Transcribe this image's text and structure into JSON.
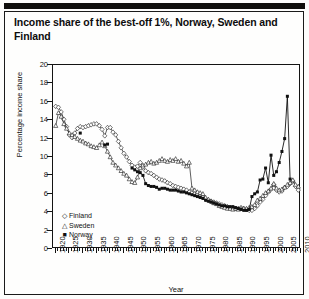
{
  "figure": {
    "title": "Income share of the best-off 1%, Norway, Sweden and Finland"
  },
  "chart_data": {
    "type": "line",
    "title": "Income share of the best-off 1%, Norway, Sweden and Finland",
    "xlabel": "Year",
    "ylabel": "Percentage income share",
    "xlim": [
      1919,
      2010
    ],
    "ylim": [
      0,
      20
    ],
    "ytick_step": 2,
    "xtick_step": 5,
    "grid": false,
    "legend_position": "bottom-left",
    "yticks": [
      0,
      2,
      4,
      6,
      8,
      10,
      12,
      14,
      16,
      18,
      20
    ],
    "xticks": [
      1920,
      1925,
      1930,
      1935,
      1940,
      1945,
      1950,
      1955,
      1960,
      1965,
      1970,
      1975,
      1980,
      1985,
      1990,
      1995,
      2000,
      2005,
      2010
    ],
    "series": [
      {
        "name": "Finland",
        "marker": "open-diamond",
        "marker_glyph": "◇",
        "color": "#1a1a1a",
        "points": [
          [
            1920,
            15.5
          ],
          [
            1921,
            15.4
          ],
          [
            1922,
            14.9
          ],
          [
            1923,
            14.1
          ],
          [
            1924,
            13.3
          ],
          [
            1925,
            12.4
          ],
          [
            1926,
            12.1
          ],
          [
            1927,
            12.6
          ],
          [
            1928,
            13.1
          ],
          [
            1929,
            13.3
          ],
          [
            1930,
            13.2
          ],
          [
            1931,
            13.3
          ],
          [
            1932,
            13.4
          ],
          [
            1933,
            13.5
          ],
          [
            1934,
            13.6
          ],
          [
            1935,
            13.6
          ],
          [
            1936,
            13.4
          ],
          [
            1937,
            13.0
          ],
          [
            1938,
            12.3
          ],
          [
            1939,
            13.2
          ],
          [
            1940,
            13.2
          ],
          [
            1941,
            12.7
          ],
          [
            1942,
            12.4
          ],
          [
            1943,
            11.7
          ],
          [
            1944,
            11.0
          ],
          [
            1945,
            10.4
          ],
          [
            1946,
            10.0
          ],
          [
            1947,
            9.5
          ],
          [
            1948,
            9.1
          ],
          [
            1949,
            8.9
          ],
          [
            1950,
            9.0
          ],
          [
            1951,
            9.4
          ],
          [
            1952,
            8.9
          ],
          [
            1953,
            8.5
          ],
          [
            1954,
            8.3
          ],
          [
            1955,
            8.2
          ],
          [
            1956,
            8.0
          ],
          [
            1957,
            7.8
          ],
          [
            1958,
            7.6
          ],
          [
            1959,
            7.5
          ],
          [
            1960,
            7.4
          ],
          [
            1961,
            7.2
          ],
          [
            1962,
            7.1
          ],
          [
            1963,
            6.9
          ],
          [
            1964,
            6.8
          ],
          [
            1965,
            6.7
          ],
          [
            1966,
            6.6
          ],
          [
            1967,
            6.5
          ],
          [
            1968,
            6.4
          ],
          [
            1969,
            6.2
          ],
          [
            1970,
            6.1
          ],
          [
            1971,
            6.0
          ],
          [
            1972,
            5.9
          ],
          [
            1973,
            5.7
          ],
          [
            1974,
            5.6
          ],
          [
            1975,
            5.4
          ],
          [
            1976,
            5.3
          ],
          [
            1977,
            5.2
          ],
          [
            1978,
            5.1
          ],
          [
            1979,
            5.0
          ],
          [
            1980,
            4.9
          ],
          [
            1981,
            4.8
          ],
          [
            1982,
            4.7
          ],
          [
            1983,
            4.6
          ],
          [
            1984,
            4.5
          ],
          [
            1985,
            4.5
          ],
          [
            1986,
            4.4
          ],
          [
            1987,
            4.4
          ],
          [
            1988,
            4.5
          ],
          [
            1989,
            4.4
          ],
          [
            1990,
            4.3
          ],
          [
            1991,
            4.2
          ],
          [
            1992,
            4.2
          ],
          [
            1993,
            4.4
          ],
          [
            1994,
            4.7
          ],
          [
            1995,
            5.1
          ],
          [
            1996,
            5.4
          ],
          [
            1997,
            5.8
          ],
          [
            1998,
            6.2
          ],
          [
            1999,
            6.5
          ],
          [
            2000,
            7.0
          ],
          [
            2001,
            6.4
          ],
          [
            2002,
            6.2
          ],
          [
            2003,
            6.3
          ],
          [
            2004,
            6.7
          ],
          [
            2005,
            6.8
          ],
          [
            2006,
            7.1
          ],
          [
            2007,
            7.4
          ],
          [
            2008,
            6.8
          ],
          [
            2009,
            6.4
          ]
        ]
      },
      {
        "name": "Sweden",
        "marker": "open-triangle",
        "marker_glyph": "△",
        "color": "#1a1a1a",
        "points": [
          [
            1920,
            13.4
          ],
          [
            1921,
            14.8
          ],
          [
            1922,
            14.4
          ],
          [
            1923,
            13.6
          ],
          [
            1924,
            13.1
          ],
          [
            1925,
            12.6
          ],
          [
            1926,
            12.4
          ],
          [
            1927,
            12.2
          ],
          [
            1928,
            12.0
          ],
          [
            1929,
            11.8
          ],
          [
            1930,
            11.7
          ],
          [
            1931,
            11.5
          ],
          [
            1932,
            11.4
          ],
          [
            1933,
            11.2
          ],
          [
            1934,
            11.1
          ],
          [
            1935,
            11.0
          ],
          [
            1936,
            11.3
          ],
          [
            1937,
            11.6
          ],
          [
            1938,
            11.2
          ],
          [
            1939,
            10.6
          ],
          [
            1940,
            10.0
          ],
          [
            1941,
            9.4
          ],
          [
            1942,
            9.1
          ],
          [
            1943,
            8.8
          ],
          [
            1944,
            8.5
          ],
          [
            1945,
            8.2
          ],
          [
            1946,
            8.0
          ],
          [
            1947,
            7.6
          ],
          [
            1948,
            7.3
          ],
          [
            1949,
            7.2
          ],
          [
            1950,
            7.8
          ],
          [
            1951,
            8.8
          ],
          [
            1952,
            9.1
          ],
          [
            1953,
            9.2
          ],
          [
            1954,
            9.4
          ],
          [
            1955,
            9.5
          ],
          [
            1956,
            9.3
          ],
          [
            1957,
            9.4
          ],
          [
            1958,
            9.6
          ],
          [
            1959,
            9.8
          ],
          [
            1960,
            9.6
          ],
          [
            1961,
            9.5
          ],
          [
            1962,
            9.7
          ],
          [
            1963,
            9.6
          ],
          [
            1964,
            9.8
          ],
          [
            1965,
            9.5
          ],
          [
            1966,
            9.6
          ],
          [
            1967,
            9.3
          ],
          [
            1968,
            9.0
          ],
          [
            1969,
            9.4
          ],
          [
            1970,
            6.6
          ],
          [
            1971,
            6.4
          ],
          [
            1972,
            6.2
          ],
          [
            1973,
            6.1
          ],
          [
            1974,
            6.0
          ],
          [
            1975,
            5.6
          ],
          [
            1976,
            5.4
          ],
          [
            1977,
            5.2
          ],
          [
            1978,
            5.0
          ],
          [
            1979,
            4.9
          ],
          [
            1980,
            4.7
          ],
          [
            1981,
            4.6
          ],
          [
            1982,
            4.5
          ],
          [
            1983,
            4.4
          ],
          [
            1984,
            4.4
          ],
          [
            1985,
            4.3
          ],
          [
            1986,
            4.4
          ],
          [
            1987,
            4.3
          ],
          [
            1988,
            4.4
          ],
          [
            1989,
            4.4
          ],
          [
            1990,
            4.4
          ],
          [
            1991,
            4.5
          ],
          [
            1992,
            4.6
          ],
          [
            1993,
            4.8
          ],
          [
            1994,
            5.3
          ],
          [
            1995,
            5.5
          ],
          [
            1996,
            5.8
          ],
          [
            1997,
            6.1
          ],
          [
            1998,
            6.3
          ],
          [
            1999,
            6.6
          ],
          [
            2000,
            7.1
          ],
          [
            2001,
            6.6
          ],
          [
            2002,
            6.4
          ],
          [
            2003,
            6.5
          ],
          [
            2004,
            6.7
          ],
          [
            2005,
            7.0
          ],
          [
            2006,
            7.2
          ],
          [
            2007,
            7.5
          ],
          [
            2008,
            7.0
          ],
          [
            2009,
            6.8
          ]
        ]
      },
      {
        "name": "Norway",
        "marker": "filled-square",
        "marker_glyph": "■",
        "color": "#111111",
        "points": [
          [
            1929,
            12.6
          ],
          [
            1938,
            11.3
          ],
          [
            1939,
            11.4
          ],
          [
            1948,
            8.8
          ],
          [
            1949,
            8.6
          ],
          [
            1950,
            8.4
          ],
          [
            1951,
            8.3
          ],
          [
            1952,
            8.0
          ],
          [
            1953,
            7.1
          ],
          [
            1954,
            6.9
          ],
          [
            1955,
            6.8
          ],
          [
            1956,
            6.8
          ],
          [
            1957,
            6.7
          ],
          [
            1958,
            6.5
          ],
          [
            1959,
            6.6
          ],
          [
            1960,
            6.6
          ],
          [
            1961,
            6.5
          ],
          [
            1962,
            6.4
          ],
          [
            1963,
            6.4
          ],
          [
            1964,
            6.4
          ],
          [
            1965,
            6.3
          ],
          [
            1966,
            6.2
          ],
          [
            1967,
            6.2
          ],
          [
            1968,
            6.1
          ],
          [
            1969,
            6.0
          ],
          [
            1970,
            5.9
          ],
          [
            1971,
            5.8
          ],
          [
            1972,
            5.7
          ],
          [
            1973,
            5.6
          ],
          [
            1974,
            5.5
          ],
          [
            1975,
            5.3
          ],
          [
            1976,
            5.2
          ],
          [
            1977,
            5.1
          ],
          [
            1978,
            5.0
          ],
          [
            1979,
            4.9
          ],
          [
            1980,
            4.8
          ],
          [
            1981,
            4.7
          ],
          [
            1982,
            4.7
          ],
          [
            1983,
            4.6
          ],
          [
            1984,
            4.6
          ],
          [
            1985,
            4.6
          ],
          [
            1986,
            4.5
          ],
          [
            1987,
            4.4
          ],
          [
            1988,
            4.3
          ],
          [
            1989,
            4.2
          ],
          [
            1990,
            4.2
          ],
          [
            1991,
            4.3
          ],
          [
            1992,
            5.7
          ],
          [
            1993,
            6.0
          ],
          [
            1994,
            6.2
          ],
          [
            1995,
            7.5
          ],
          [
            1996,
            7.6
          ],
          [
            1997,
            8.8
          ],
          [
            1998,
            7.2
          ],
          [
            1999,
            10.2
          ],
          [
            2000,
            8.0
          ],
          [
            2001,
            8.4
          ],
          [
            2002,
            9.4
          ],
          [
            2003,
            10.6
          ],
          [
            2004,
            12.0
          ],
          [
            2005,
            16.6
          ],
          [
            2006,
            7.6
          ]
        ]
      }
    ],
    "legend": [
      {
        "label": "Finland",
        "marker_glyph": "◇"
      },
      {
        "label": "Sweden",
        "marker_glyph": "△"
      },
      {
        "label": "Norway",
        "marker_glyph": "■"
      }
    ]
  }
}
